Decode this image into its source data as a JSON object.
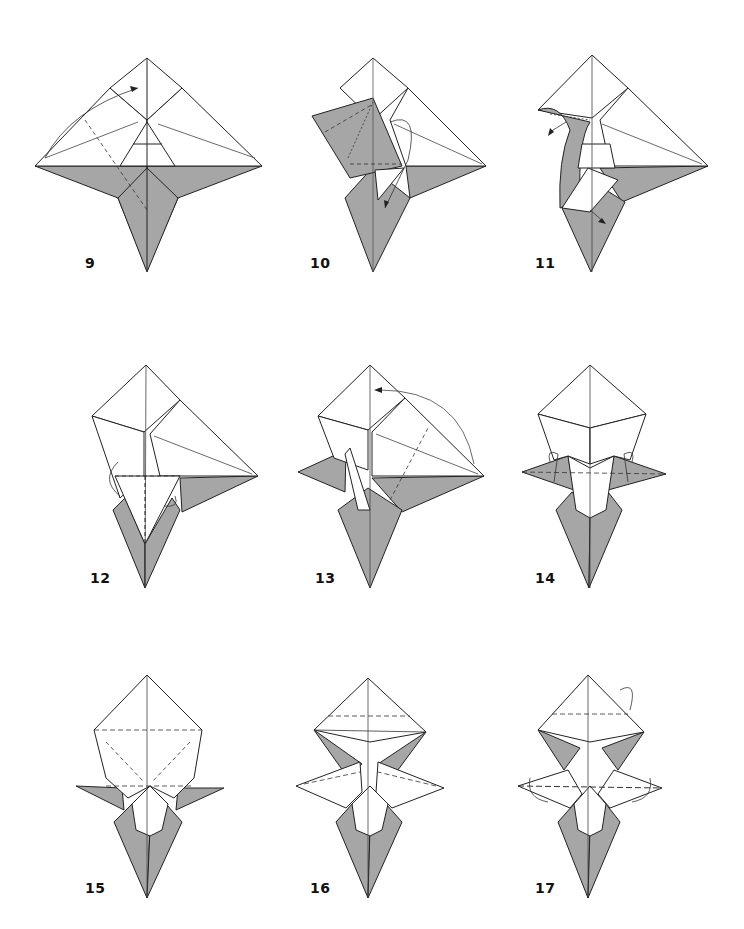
{
  "page": {
    "background": "#ffffff"
  },
  "colors": {
    "paper_front": "#ffffff",
    "paper_back": "#a6a6a6",
    "line": "#222222"
  },
  "steps": [
    {
      "number": "9",
      "x": 30,
      "y": 40,
      "label_x": 85,
      "label_y": 255
    },
    {
      "number": "10",
      "x": 290,
      "y": 40,
      "label_x": 310,
      "label_y": 255
    },
    {
      "number": "11",
      "x": 510,
      "y": 40,
      "label_x": 535,
      "label_y": 255
    },
    {
      "number": "12",
      "x": 80,
      "y": 360,
      "label_x": 90,
      "label_y": 570
    },
    {
      "number": "13",
      "x": 290,
      "y": 360,
      "label_x": 315,
      "label_y": 570
    },
    {
      "number": "14",
      "x": 510,
      "y": 360,
      "label_x": 535,
      "label_y": 570
    },
    {
      "number": "15",
      "x": 70,
      "y": 670,
      "label_x": 85,
      "label_y": 880
    },
    {
      "number": "16",
      "x": 290,
      "y": 670,
      "label_x": 310,
      "label_y": 880
    },
    {
      "number": "17",
      "x": 510,
      "y": 670,
      "label_x": 535,
      "label_y": 880
    }
  ]
}
